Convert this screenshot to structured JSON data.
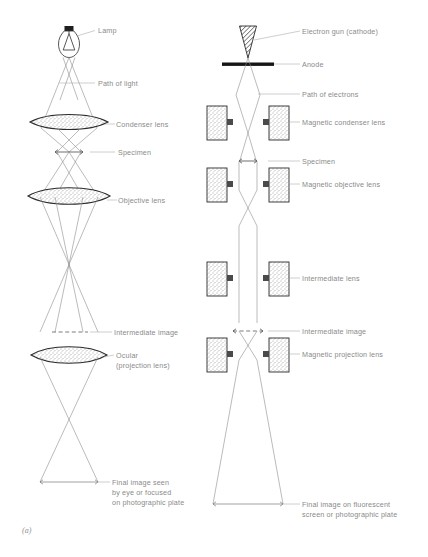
{
  "figure": {
    "panel_label": "(a)",
    "background_color": "#ffffff",
    "label_color": "#8a8a8a",
    "line_color": "#8d8d8d",
    "outline_color": "#3a3a3a"
  },
  "light_microscope": {
    "labels": {
      "lamp": "Lamp",
      "path_of_light": "Path of light",
      "condenser_lens": "Condenser lens",
      "specimen": "Specimen",
      "objective_lens": "Objective lens",
      "intermediate_image": "Intermediate image",
      "ocular_line1": "Ocular",
      "ocular_line2": "(projection lens)",
      "final_image_line1": "Final image seen",
      "final_image_line2": "by eye or focused",
      "final_image_line3": "on photographic plate"
    }
  },
  "electron_microscope": {
    "labels": {
      "electron_gun": "Electron gun (cathode)",
      "anode": "Anode",
      "path_of_electrons": "Path of electrons",
      "magnetic_condenser_lens": "Magnetic condenser lens",
      "specimen": "Specimen",
      "magnetic_objective_lens": "Magnetic objective lens",
      "intermediate_lens": "Intermediate lens",
      "intermediate_image": "Intermediate image",
      "magnetic_projection_lens": "Magnetic projection lens",
      "final_image_line1": "Final image on fluorescent",
      "final_image_line2": "screen or photographic plate"
    }
  }
}
